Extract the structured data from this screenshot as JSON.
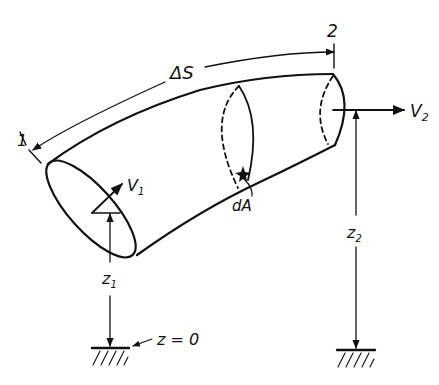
{
  "diagram": {
    "labels": {
      "station_1": "1",
      "station_2": "2",
      "arc_length": "ΔS",
      "velocity_1": "V",
      "velocity_1_sub": "1",
      "velocity_2": "V",
      "velocity_2_sub": "2",
      "area_element": "dA",
      "elevation_1": "z",
      "elevation_1_sub": "1",
      "elevation_2": "z",
      "elevation_2_sub": "2",
      "datum": "z = 0"
    },
    "colors": {
      "ink": "#111111",
      "background": "#ffffff"
    }
  }
}
